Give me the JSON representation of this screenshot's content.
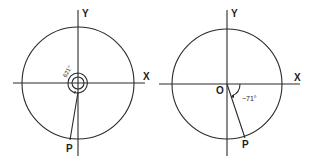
{
  "figures": [
    {
      "id": "left",
      "x_axis_label": "X",
      "y_axis_label": "Y",
      "point_label": "P",
      "angle_label": "621°",
      "angle_degrees": 621
    },
    {
      "id": "right",
      "x_axis_label": "X",
      "y_axis_label": "Y",
      "origin_label": "O",
      "point_label": "P",
      "angle_label": "−71°",
      "angle_degrees": -71
    }
  ]
}
